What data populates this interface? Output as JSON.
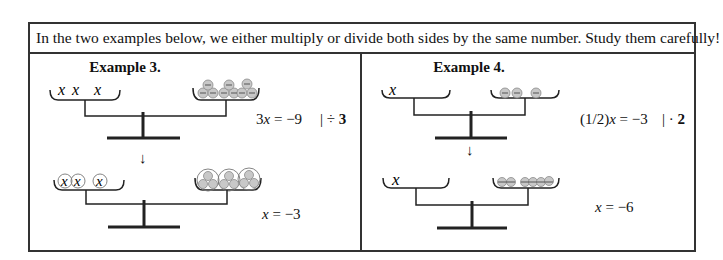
{
  "intro": "In the two examples below, we either multiply or divide both sides by the same number. Study them carefully!",
  "examples": [
    {
      "title": "Example 3.",
      "step1": {
        "equation_pre": "3",
        "var": "x",
        "equation_post": " = −9",
        "operation_bar": "| ÷ ",
        "operation_value": "3"
      },
      "arrow": "↓",
      "step2": {
        "var": "x",
        "equation_post": " = −3"
      },
      "scale1": {
        "left_items": [
          "x",
          "x",
          "x"
        ],
        "right_negative_ones": 9
      },
      "scale2": {
        "left_items": [
          "x",
          "x",
          "x"
        ],
        "left_grouped": true,
        "right_negative_ones": 9,
        "right_groups": 3
      }
    },
    {
      "title": "Example 4.",
      "step1": {
        "equation_pre": "(1/2)",
        "var": "x",
        "equation_post": " = −3",
        "operation_bar": "| · ",
        "operation_value": "2"
      },
      "arrow": "↓",
      "step2": {
        "var": "x",
        "equation_post": " = −6"
      },
      "scale1": {
        "left_items": [
          "x"
        ],
        "right_negative_ones": 3
      },
      "scale2": {
        "left_items": [
          "x"
        ],
        "right_negative_ones": 6
      }
    }
  ],
  "colors": {
    "border": "#333333",
    "chip_fill": "#c8c8c8",
    "chip_stroke": "#8a8a8a",
    "line": "#222222"
  }
}
